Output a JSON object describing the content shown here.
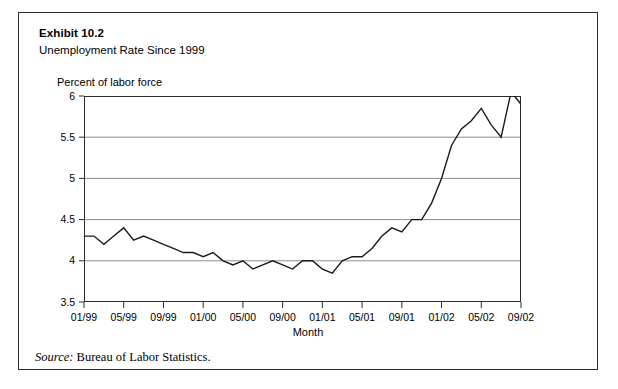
{
  "exhibit": {
    "number": "Exhibit 10.2",
    "title": "Unemployment Rate Since 1999",
    "source_label": "Source:",
    "source_text": " Bureau of Labor Statistics."
  },
  "chart_data": {
    "type": "line",
    "title": "Unemployment Rate Since 1999",
    "ylabel": "Percent of labor force",
    "xlabel": "Month",
    "ylim": [
      3.5,
      6.0
    ],
    "yticks": [
      "3.5",
      "4",
      "4.5",
      "5",
      "5.5",
      "6"
    ],
    "ytick_values": [
      3.5,
      4,
      4.5,
      5,
      5.5,
      6
    ],
    "grid": true,
    "legend": "none",
    "xticks": [
      "01/99",
      "05/99",
      "09/99",
      "01/00",
      "05/00",
      "09/00",
      "01/01",
      "05/01",
      "09/01",
      "01/02",
      "05/02",
      "09/02"
    ],
    "x": [
      "01/99",
      "02/99",
      "03/99",
      "04/99",
      "05/99",
      "06/99",
      "07/99",
      "08/99",
      "09/99",
      "10/99",
      "11/99",
      "12/99",
      "01/00",
      "02/00",
      "03/00",
      "04/00",
      "05/00",
      "06/00",
      "07/00",
      "08/00",
      "09/00",
      "10/00",
      "11/00",
      "12/00",
      "01/01",
      "02/01",
      "03/01",
      "04/01",
      "05/01",
      "06/01",
      "07/01",
      "08/01",
      "09/01",
      "10/01",
      "11/01",
      "12/01",
      "01/02",
      "02/02",
      "03/02",
      "04/02",
      "05/02",
      "06/02",
      "07/02",
      "08/02",
      "09/02"
    ],
    "values": [
      4.3,
      4.3,
      4.2,
      4.3,
      4.4,
      4.25,
      4.3,
      4.25,
      4.2,
      4.15,
      4.1,
      4.1,
      4.05,
      4.1,
      4.0,
      3.95,
      4.0,
      3.9,
      3.95,
      4.0,
      3.95,
      3.9,
      4.0,
      4.0,
      3.9,
      3.85,
      4.0,
      4.05,
      4.05,
      4.15,
      4.3,
      4.4,
      4.35,
      4.5,
      4.5,
      4.7,
      5.0,
      5.4,
      5.6,
      5.7,
      5.85,
      5.65,
      5.5,
      6.05,
      5.9
    ],
    "line_color": "#1a1a1a",
    "grid_color": "#8c8c8c",
    "axis_color": "#2b2b2b"
  }
}
